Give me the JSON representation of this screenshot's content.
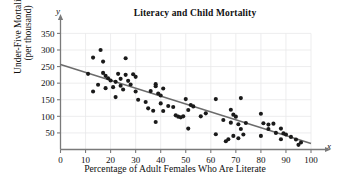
{
  "chart_data": {
    "type": "scatter",
    "title": "Literacy and Child Mortality",
    "xlabel": "Percentage of Adult Females Who Are Literate",
    "ylabel_line1": "Under-Five Mortality",
    "ylabel_line2": "(per thousand)",
    "x_axis_symbol": "x",
    "y_axis_symbol": "y",
    "xlim": [
      0,
      103
    ],
    "ylim": [
      0,
      365
    ],
    "xticks": [
      0,
      10,
      20,
      30,
      40,
      50,
      60,
      70,
      80,
      90,
      100
    ],
    "yticks": [
      50,
      100,
      150,
      200,
      250,
      300,
      350
    ],
    "grid": true,
    "grid_color": "#e8e8ea",
    "point_color": "#1a1a1a",
    "line_color": "#6b6b6b",
    "axis_color": "#7a7a7a",
    "trendline": {
      "x_start": 0,
      "y_start": 256,
      "x_end": 100,
      "y_end": 18
    },
    "points": [
      {
        "x": 11,
        "y": 228
      },
      {
        "x": 13,
        "y": 277
      },
      {
        "x": 13,
        "y": 175
      },
      {
        "x": 15,
        "y": 195
      },
      {
        "x": 16,
        "y": 300
      },
      {
        "x": 17,
        "y": 265
      },
      {
        "x": 17,
        "y": 231
      },
      {
        "x": 18,
        "y": 222
      },
      {
        "x": 18,
        "y": 185
      },
      {
        "x": 19,
        "y": 215
      },
      {
        "x": 20,
        "y": 208
      },
      {
        "x": 21,
        "y": 188
      },
      {
        "x": 22,
        "y": 204
      },
      {
        "x": 22,
        "y": 158
      },
      {
        "x": 23,
        "y": 228
      },
      {
        "x": 24,
        "y": 213
      },
      {
        "x": 24,
        "y": 192
      },
      {
        "x": 25,
        "y": 181
      },
      {
        "x": 26,
        "y": 275
      },
      {
        "x": 26,
        "y": 225
      },
      {
        "x": 27,
        "y": 207
      },
      {
        "x": 28,
        "y": 196
      },
      {
        "x": 29,
        "y": 227
      },
      {
        "x": 30,
        "y": 219
      },
      {
        "x": 30,
        "y": 175
      },
      {
        "x": 31,
        "y": 150
      },
      {
        "x": 34,
        "y": 143
      },
      {
        "x": 35,
        "y": 124
      },
      {
        "x": 36,
        "y": 176
      },
      {
        "x": 37,
        "y": 117
      },
      {
        "x": 38,
        "y": 197
      },
      {
        "x": 38,
        "y": 191
      },
      {
        "x": 38,
        "y": 83
      },
      {
        "x": 39,
        "y": 169
      },
      {
        "x": 40,
        "y": 163
      },
      {
        "x": 40,
        "y": 139
      },
      {
        "x": 41,
        "y": 184
      },
      {
        "x": 41,
        "y": 116
      },
      {
        "x": 43,
        "y": 131
      },
      {
        "x": 45,
        "y": 128
      },
      {
        "x": 46,
        "y": 103
      },
      {
        "x": 47,
        "y": 99
      },
      {
        "x": 48,
        "y": 97
      },
      {
        "x": 49,
        "y": 100
      },
      {
        "x": 50,
        "y": 152
      },
      {
        "x": 51,
        "y": 119
      },
      {
        "x": 51,
        "y": 63
      },
      {
        "x": 52,
        "y": 134
      },
      {
        "x": 53,
        "y": 130
      },
      {
        "x": 56,
        "y": 100
      },
      {
        "x": 58,
        "y": 109
      },
      {
        "x": 62,
        "y": 152
      },
      {
        "x": 62,
        "y": 46
      },
      {
        "x": 65,
        "y": 89
      },
      {
        "x": 66,
        "y": 25
      },
      {
        "x": 67,
        "y": 31
      },
      {
        "x": 68,
        "y": 120
      },
      {
        "x": 68,
        "y": 81
      },
      {
        "x": 69,
        "y": 105
      },
      {
        "x": 69,
        "y": 41
      },
      {
        "x": 70,
        "y": 99
      },
      {
        "x": 71,
        "y": 76
      },
      {
        "x": 71,
        "y": 34
      },
      {
        "x": 72,
        "y": 155
      },
      {
        "x": 72,
        "y": 62
      },
      {
        "x": 73,
        "y": 45
      },
      {
        "x": 74,
        "y": 80
      },
      {
        "x": 80,
        "y": 108
      },
      {
        "x": 80,
        "y": 41
      },
      {
        "x": 81,
        "y": 79
      },
      {
        "x": 83,
        "y": 75
      },
      {
        "x": 83,
        "y": 62
      },
      {
        "x": 85,
        "y": 78
      },
      {
        "x": 86,
        "y": 50
      },
      {
        "x": 88,
        "y": 63
      },
      {
        "x": 88,
        "y": 31
      },
      {
        "x": 89,
        "y": 49
      },
      {
        "x": 90,
        "y": 45
      },
      {
        "x": 92,
        "y": 38
      },
      {
        "x": 94,
        "y": 30
      },
      {
        "x": 95,
        "y": 14
      },
      {
        "x": 96,
        "y": 21
      }
    ]
  }
}
